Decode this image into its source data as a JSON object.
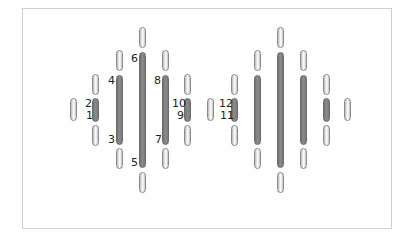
{
  "diagram": {
    "type": "channel-arrangement",
    "groups": [
      {
        "name": "left-group",
        "labeled": true,
        "columns": [
          {
            "x": 73,
            "pills": [
              [
                98,
                121
              ]
            ],
            "bar": null
          },
          {
            "x": 95,
            "pills": [
              [
                74,
                95
              ],
              [
                125,
                146
              ]
            ],
            "bar": [
              98,
              122
            ],
            "labels": {
              "top": "2",
              "bottom": "1"
            }
          },
          {
            "x": 119,
            "pills": [
              [
                50,
                71
              ],
              [
                148,
                169
              ]
            ],
            "bar": [
              75,
              145
            ],
            "labels": {
              "top": "4",
              "bottom": "3"
            }
          },
          {
            "x": 142,
            "pills": [
              [
                27,
                48
              ],
              [
                172,
                193
              ]
            ],
            "bar": [
              52,
              168
            ],
            "labels": {
              "top": "6",
              "bottom": "5"
            }
          },
          {
            "x": 165,
            "pills": [
              [
                50,
                71
              ],
              [
                148,
                169
              ]
            ],
            "bar": [
              75,
              145
            ],
            "labels": {
              "top": "8",
              "bottom": "7"
            }
          },
          {
            "x": 187,
            "pills": [
              [
                74,
                95
              ],
              [
                125,
                146
              ]
            ],
            "bar": [
              98,
              122
            ],
            "labels": {
              "top": "10",
              "bottom": "9"
            }
          },
          {
            "x": 210,
            "pills": [
              [
                98,
                121
              ]
            ],
            "bar": null
          }
        ]
      },
      {
        "name": "right-group",
        "labeled": true,
        "columns": [
          {
            "x": 234,
            "pills": [
              [
                74,
                95
              ],
              [
                125,
                146
              ]
            ],
            "bar": [
              98,
              122
            ],
            "labels": {
              "top": "12",
              "bottom": "11"
            }
          },
          {
            "x": 257,
            "pills": [
              [
                50,
                71
              ],
              [
                148,
                169
              ]
            ],
            "bar": [
              75,
              145
            ]
          },
          {
            "x": 280,
            "pills": [
              [
                27,
                48
              ],
              [
                172,
                193
              ]
            ],
            "bar": [
              52,
              168
            ]
          },
          {
            "x": 303,
            "pills": [
              [
                50,
                71
              ],
              [
                148,
                169
              ]
            ],
            "bar": [
              75,
              145
            ]
          },
          {
            "x": 326,
            "pills": [
              [
                74,
                95
              ],
              [
                125,
                146
              ]
            ],
            "bar": [
              98,
              122
            ]
          },
          {
            "x": 347,
            "pills": [
              [
                98,
                121
              ]
            ],
            "bar": null
          }
        ]
      }
    ],
    "labels": {
      "l1": "1",
      "l2": "2",
      "l3": "3",
      "l4": "4",
      "l5": "5",
      "l6": "6",
      "l7": "7",
      "l8": "8",
      "l9": "9",
      "l10": "10",
      "l11": "11",
      "l12": "12"
    },
    "colors": {
      "bar": "#7a7a7a",
      "pill_border": "#8a8a8a",
      "frame": "#cfcfcf"
    }
  }
}
